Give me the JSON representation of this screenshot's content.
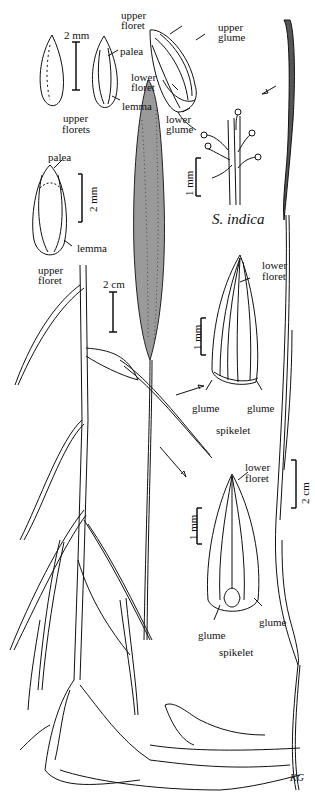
{
  "figure": {
    "species": "S. indica",
    "signature": "KG"
  },
  "panels": {
    "upper_florets_pair": {
      "scale": "2 mm",
      "labels": {
        "palea": "palea",
        "lemma": "lemma",
        "caption": "upper\nflorets",
        "caption_l1": "upper",
        "caption_l2": "florets"
      }
    },
    "spikelet_top": {
      "labels": {
        "upper_floret_l1": "upper",
        "upper_floret_l2": "floret",
        "upper_glume_l1": "upper",
        "upper_glume_l2": "glume",
        "lower_floret_l1": "lower",
        "lower_floret_l2": "floret",
        "lower_glume_l1": "lower",
        "lower_glume_l2": "glume"
      }
    },
    "inflorescence_detail": {
      "scale": "1 mm"
    },
    "upper_floret_single": {
      "scale": "2 mm",
      "labels": {
        "palea": "palea",
        "lemma": "lemma",
        "caption_l1": "upper",
        "caption_l2": "floret"
      }
    },
    "habit": {
      "scale": "2 cm"
    },
    "spikelet_side": {
      "scale": "1 mm",
      "labels": {
        "lower_floret_l1": "lower",
        "lower_floret_l2": "floret",
        "glume_left": "glume",
        "glume_right": "glume",
        "caption": "spikelet"
      }
    },
    "spikelet_front": {
      "scale": "1 mm",
      "labels": {
        "lower_floret_l1": "lower",
        "lower_floret_l2": "floret",
        "glume_left": "glume",
        "glume_right": "glume",
        "caption": "spikelet"
      }
    },
    "culm_right": {
      "scale": "2 cm"
    }
  }
}
